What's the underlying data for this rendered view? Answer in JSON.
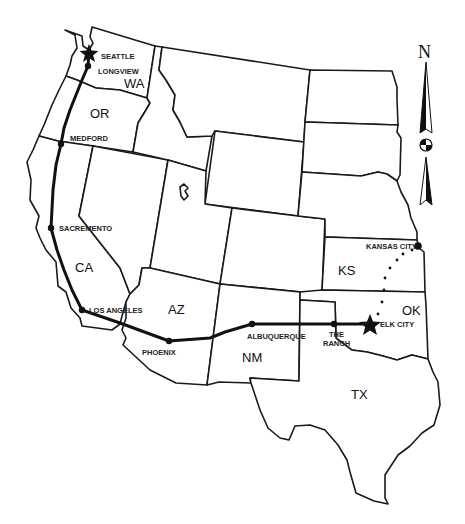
{
  "map": {
    "title": "Western United States route map",
    "route_color": "#111111",
    "background": "#ffffff",
    "state_labels": [
      {
        "id": "wa",
        "text": "WA",
        "x": 124,
        "y": 88
      },
      {
        "id": "or",
        "text": "OR",
        "x": 92,
        "y": 118
      },
      {
        "id": "ca",
        "text": "CA",
        "x": 77,
        "y": 272
      },
      {
        "id": "az",
        "text": "AZ",
        "x": 167,
        "y": 314
      },
      {
        "id": "nm",
        "text": "NM",
        "x": 244,
        "y": 362
      },
      {
        "id": "ks",
        "text": "KS",
        "x": 339,
        "y": 275
      },
      {
        "id": "ok",
        "text": "OK",
        "x": 403,
        "y": 315
      },
      {
        "id": "tx",
        "text": "TX",
        "x": 351,
        "y": 399
      }
    ],
    "cities": [
      {
        "id": "seattle",
        "name": "SEATTLE",
        "marker": "star",
        "x": 89,
        "y": 53,
        "label_x": 101,
        "label_y": 59
      },
      {
        "id": "longview",
        "name": "LONGVIEW",
        "marker": "dot",
        "x": 88,
        "y": 66,
        "label_x": 98,
        "label_y": 73
      },
      {
        "id": "medford",
        "name": "MEDFORD",
        "marker": "dot",
        "x": 61,
        "y": 144,
        "label_x": 70,
        "label_y": 140
      },
      {
        "id": "sacremento",
        "name": "SACREMENTO",
        "marker": "dot",
        "x": 51,
        "y": 228,
        "label_x": 59,
        "label_y": 230
      },
      {
        "id": "los-angeles",
        "name": "LOS ANGELES",
        "marker": "dot",
        "x": 82,
        "y": 310,
        "label_x": 89,
        "label_y": 313
      },
      {
        "id": "phoenix",
        "name": "PHOENIX",
        "marker": "dot",
        "x": 169,
        "y": 341,
        "label_x": 142,
        "label_y": 355
      },
      {
        "id": "albuquerque",
        "name": "ALBUQUERQUE",
        "marker": "dot",
        "x": 252,
        "y": 324,
        "label_x": 248,
        "label_y": 339
      },
      {
        "id": "the-ranch",
        "name_line1": "THE",
        "name_line2": "RANCH",
        "marker": "dot",
        "x": 334,
        "y": 324,
        "label_x": 334,
        "label_y": 337
      },
      {
        "id": "elk-city",
        "name": "ELK CITY",
        "marker": "star",
        "x": 370,
        "y": 324,
        "label_x": 380,
        "label_y": 327
      },
      {
        "id": "kansas-city",
        "name": "KANSAS CITY",
        "marker": "dot",
        "x": 418,
        "y": 246,
        "label_x": 366,
        "label_y": 249
      }
    ],
    "route_solid": "Seattle → Longview → Medford → Sacremento → Los Angeles → Phoenix → Albuquerque → The Ranch → Elk City",
    "route_dotted": "Elk City → Kansas City",
    "compass": {
      "label": "N",
      "x": 425,
      "y": 58
    }
  }
}
